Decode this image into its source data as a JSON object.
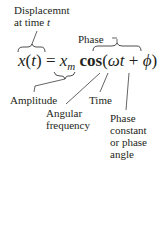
{
  "labels": {
    "displacement_line1": "Displacemnt",
    "displacement_line2": "at time ",
    "displacement_var": "t",
    "phase": "Phase",
    "amplitude": "Amplitude",
    "time": "Time",
    "angular_line1": "Angular",
    "angular_line2": "frequency",
    "phase_const_line1": "Phase",
    "phase_const_line2": "constant",
    "phase_const_line3": "or phase",
    "phase_const_line4": "angle"
  },
  "equation": {
    "x": "x",
    "open_paren": "(",
    "t": "t",
    "close_paren": ")",
    "equals": " = ",
    "xm_base": "x",
    "xm_sub": "m",
    "cos": " cos",
    "open2": "(",
    "omega": "ω",
    "t2": "t",
    "plus": " + ",
    "phi": "ϕ",
    "close2": ")"
  }
}
